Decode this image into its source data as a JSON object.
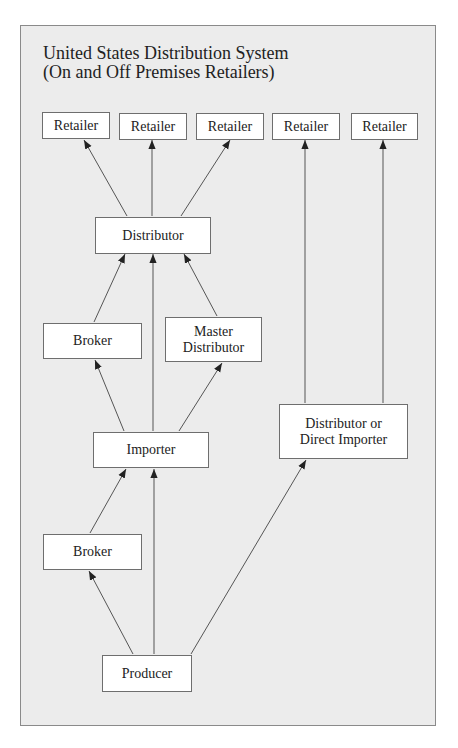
{
  "diagram": {
    "title_line1": "United States Distribution System",
    "title_line2": "(On and Off Premises Retailers)",
    "nodes": {
      "retailer1": "Retailer",
      "retailer2": "Retailer",
      "retailer3": "Retailer",
      "retailer4": "Retailer",
      "retailer5": "Retailer",
      "distributor": "Distributor",
      "broker_upper": "Broker",
      "master_distributor_line1": "Master",
      "master_distributor_line2": "Distributor",
      "importer": "Importer",
      "distributor_or_direct_importer_line1": "Distributor or",
      "distributor_or_direct_importer_line2": "Direct Importer",
      "broker_lower": "Broker",
      "producer": "Producer"
    },
    "edges": [
      {
        "from": "Producer",
        "to": "Broker (lower)"
      },
      {
        "from": "Producer",
        "to": "Importer"
      },
      {
        "from": "Producer",
        "to": "Distributor or Direct Importer"
      },
      {
        "from": "Broker (lower)",
        "to": "Importer"
      },
      {
        "from": "Importer",
        "to": "Broker (upper)"
      },
      {
        "from": "Importer",
        "to": "Distributor"
      },
      {
        "from": "Importer",
        "to": "Master Distributor"
      },
      {
        "from": "Broker (upper)",
        "to": "Distributor"
      },
      {
        "from": "Master Distributor",
        "to": "Distributor"
      },
      {
        "from": "Distributor",
        "to": "Retailer 1"
      },
      {
        "from": "Distributor",
        "to": "Retailer 2"
      },
      {
        "from": "Distributor",
        "to": "Retailer 3"
      },
      {
        "from": "Distributor or Direct Importer",
        "to": "Retailer 4"
      },
      {
        "from": "Distributor or Direct Importer",
        "to": "Retailer 5"
      }
    ]
  }
}
